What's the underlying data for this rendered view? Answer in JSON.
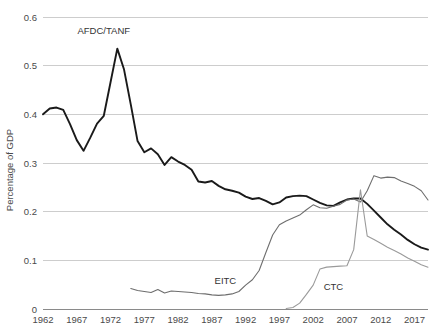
{
  "chart_data": {
    "type": "line",
    "title": "",
    "xlabel": "",
    "ylabel": "Percentage of GDP",
    "xlim": [
      1962,
      2019
    ],
    "ylim": [
      0,
      0.6
    ],
    "grid": true,
    "legend_position": "inline-annotations",
    "x_ticks": [
      "1962",
      "1967",
      "1972",
      "1977",
      "1982",
      "1987",
      "1992",
      "1997",
      "2002",
      "2007",
      "2012",
      "2017"
    ],
    "y_ticks": [
      "0",
      "0.1",
      "0.2",
      "0.3",
      "0.4",
      "0.5",
      "0.6"
    ],
    "x": [
      1962,
      1963,
      1964,
      1965,
      1966,
      1967,
      1968,
      1969,
      1970,
      1971,
      1972,
      1973,
      1974,
      1975,
      1976,
      1977,
      1978,
      1979,
      1980,
      1981,
      1982,
      1983,
      1984,
      1985,
      1986,
      1987,
      1988,
      1989,
      1990,
      1991,
      1992,
      1993,
      1994,
      1995,
      1996,
      1997,
      1998,
      1999,
      2000,
      2001,
      2002,
      2003,
      2004,
      2005,
      2006,
      2007,
      2008,
      2009,
      2010,
      2011,
      2012,
      2013,
      2014,
      2015,
      2016,
      2017,
      2018,
      2019
    ],
    "series": [
      {
        "name": "AFDC/TANF",
        "color": "#1a1a1a",
        "stroke_width": 1.9,
        "label_x": 1971,
        "label_y": 0.565,
        "values": [
          0.4,
          0.412,
          0.414,
          0.409,
          0.38,
          0.347,
          0.325,
          0.352,
          0.381,
          0.397,
          0.466,
          0.535,
          0.492,
          0.42,
          0.345,
          0.322,
          0.33,
          0.318,
          0.296,
          0.312,
          0.303,
          0.296,
          0.286,
          0.262,
          0.26,
          0.263,
          0.253,
          0.246,
          0.243,
          0.239,
          0.231,
          0.226,
          0.228,
          0.222,
          0.215,
          0.219,
          0.229,
          0.232,
          0.233,
          0.232,
          0.225,
          0.218,
          0.213,
          0.212,
          0.219,
          0.225,
          0.227,
          0.227,
          0.216,
          0.202,
          0.188,
          0.174,
          0.163,
          0.153,
          0.142,
          0.133,
          0.126,
          0.122
        ]
      },
      {
        "name": "EITC",
        "color": "#6e6e6e",
        "stroke_width": 1.1,
        "label_x": 1989,
        "label_y": 0.052,
        "values": [
          null,
          null,
          null,
          null,
          null,
          null,
          null,
          null,
          null,
          null,
          null,
          null,
          null,
          0.042,
          0.038,
          0.036,
          0.034,
          0.04,
          0.033,
          0.037,
          0.036,
          0.035,
          0.034,
          0.032,
          0.031,
          0.029,
          0.028,
          0.029,
          0.031,
          0.036,
          0.049,
          0.06,
          0.079,
          0.116,
          0.152,
          0.173,
          0.181,
          0.187,
          0.193,
          0.204,
          0.214,
          0.208,
          0.207,
          0.211,
          0.215,
          0.224,
          0.226,
          0.22,
          0.243,
          0.274,
          0.269,
          0.271,
          0.27,
          0.263,
          0.258,
          0.252,
          0.243,
          0.224
        ]
      },
      {
        "name": "CTC",
        "color": "#9a9a9a",
        "stroke_width": 1.1,
        "label_x": 2005,
        "label_y": 0.04,
        "values": [
          null,
          null,
          null,
          null,
          null,
          null,
          null,
          null,
          null,
          null,
          null,
          null,
          null,
          null,
          null,
          null,
          null,
          null,
          null,
          null,
          null,
          null,
          null,
          null,
          null,
          null,
          null,
          null,
          null,
          null,
          null,
          null,
          null,
          null,
          null,
          null,
          0.001,
          0.003,
          0.012,
          0.03,
          0.049,
          0.082,
          0.086,
          0.087,
          0.088,
          0.089,
          0.122,
          0.245,
          0.15,
          0.143,
          0.135,
          0.127,
          0.12,
          0.113,
          0.105,
          0.098,
          0.091,
          0.086
        ]
      }
    ]
  },
  "annotations": {
    "afdc": "AFDC/TANF",
    "eitc": "EITC",
    "ctc": "CTC"
  },
  "axes": {
    "y_title": "Percentage of GDP"
  }
}
